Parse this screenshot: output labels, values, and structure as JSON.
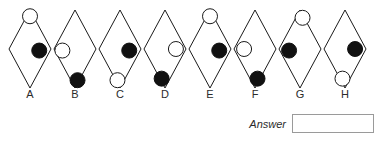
{
  "puzzle": {
    "type": "shape-sequence-multiple-choice",
    "geometry": {
      "diamond_width": 42,
      "diamond_height": 78,
      "diamond_top": 10,
      "first_center_x": 30,
      "spacing_x": 45,
      "circle_radius": 7.5,
      "outline_color": "#1a1a1a",
      "outline_width": 1,
      "filled_color": "#111111",
      "open_fill": "#ffffff"
    },
    "options": [
      {
        "label": "A",
        "name": "option-a",
        "circles": [
          {
            "fill": "open",
            "rx": 0.0,
            "ry": -0.42,
            "name": "open-circle"
          },
          {
            "fill": "filled",
            "rx": 0.22,
            "ry": 0.02,
            "name": "filled-circle"
          }
        ]
      },
      {
        "label": "B",
        "name": "option-b",
        "circles": [
          {
            "fill": "open",
            "rx": -0.3,
            "ry": 0.02,
            "name": "open-circle"
          },
          {
            "fill": "filled",
            "rx": 0.06,
            "ry": 0.4,
            "name": "filled-circle"
          }
        ]
      },
      {
        "label": "C",
        "name": "option-c",
        "circles": [
          {
            "fill": "filled",
            "rx": 0.22,
            "ry": 0.02,
            "name": "filled-circle"
          },
          {
            "fill": "open",
            "rx": -0.06,
            "ry": 0.4,
            "name": "open-circle"
          }
        ]
      },
      {
        "label": "D",
        "name": "option-d",
        "circles": [
          {
            "fill": "open",
            "rx": 0.26,
            "ry": 0.0,
            "name": "open-circle"
          },
          {
            "fill": "filled",
            "rx": -0.08,
            "ry": 0.38,
            "name": "filled-circle"
          }
        ]
      },
      {
        "label": "E",
        "name": "option-e",
        "circles": [
          {
            "fill": "open",
            "rx": 0.0,
            "ry": -0.42,
            "name": "open-circle"
          },
          {
            "fill": "filled",
            "rx": 0.22,
            "ry": 0.02,
            "name": "filled-circle"
          }
        ]
      },
      {
        "label": "F",
        "name": "option-f",
        "circles": [
          {
            "fill": "open",
            "rx": -0.26,
            "ry": 0.0,
            "name": "open-circle"
          },
          {
            "fill": "filled",
            "rx": 0.06,
            "ry": 0.38,
            "name": "filled-circle"
          }
        ]
      },
      {
        "label": "G",
        "name": "option-g",
        "circles": [
          {
            "fill": "open",
            "rx": 0.06,
            "ry": -0.4,
            "name": "open-circle"
          },
          {
            "fill": "filled",
            "rx": -0.26,
            "ry": 0.02,
            "name": "filled-circle"
          }
        ]
      },
      {
        "label": "H",
        "name": "option-h",
        "circles": [
          {
            "fill": "filled",
            "rx": 0.24,
            "ry": 0.0,
            "name": "filled-circle"
          },
          {
            "fill": "open",
            "rx": -0.06,
            "ry": 0.38,
            "name": "open-circle"
          }
        ]
      }
    ]
  },
  "answer": {
    "label": "Answer",
    "value": "",
    "placeholder": ""
  }
}
